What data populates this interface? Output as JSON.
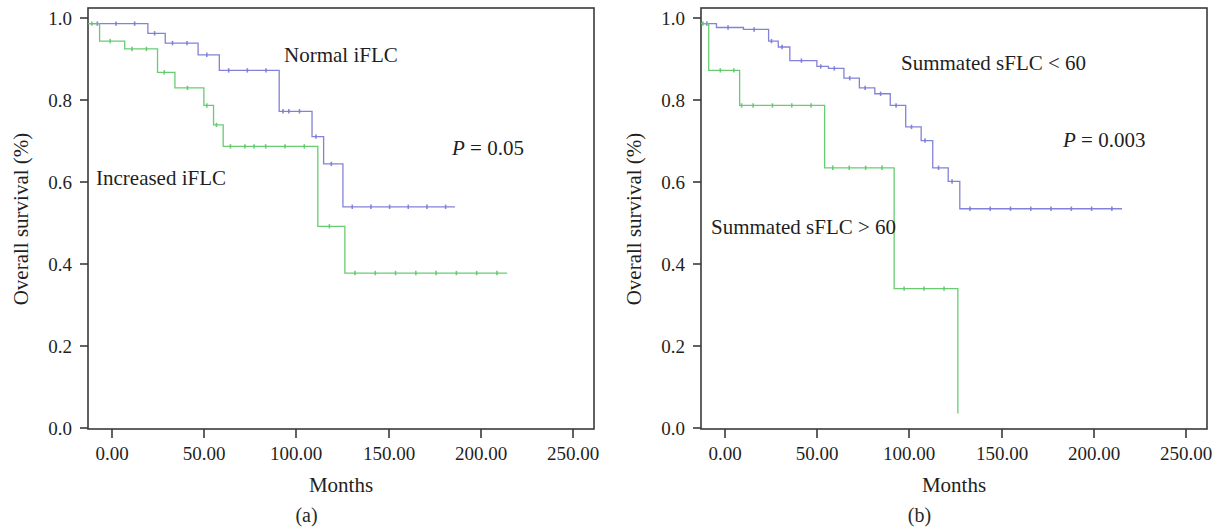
{
  "figure": {
    "panels": [
      {
        "caption": "(a)",
        "xlabel": "Months",
        "ylabel": "Overall survival (%)",
        "xticks": [
          "0.00",
          "50.00",
          "100.00",
          "150.00",
          "200.00",
          "250.00"
        ],
        "yticks": [
          "0.0",
          "0.2",
          "0.4",
          "0.6",
          "0.8",
          "1.0"
        ],
        "pvalue_symbol": "P",
        "pvalue_text": " = 0.05",
        "label_upper": "Normal iFLC",
        "label_lower": "Increased iFLC"
      },
      {
        "caption": "(b)",
        "xlabel": "Months",
        "ylabel": "Overall survival (%)",
        "xticks": [
          "0.00",
          "50.00",
          "100.00",
          "150.00",
          "200.00",
          "250.00"
        ],
        "yticks": [
          "0.0",
          "0.2",
          "0.4",
          "0.6",
          "0.8",
          "1.0"
        ],
        "pvalue_symbol": "P",
        "pvalue_text": " = 0.003",
        "label_upper": "Summated sFLC < 60",
        "label_lower": "Summated sFLC > 60"
      }
    ]
  },
  "colors": {
    "blue": "#7b7bd6",
    "green": "#5fc96a",
    "axis": "#3a3a3a",
    "text": "#1f1f1f",
    "background": "#ffffff"
  },
  "chart_data": [
    {
      "type": "line",
      "chart_style": "kaplan-meier-step",
      "title": "",
      "panel": "(a)",
      "xlabel": "Months",
      "ylabel": "Overall survival (%)",
      "xlim": [
        0,
        262
      ],
      "ylim": [
        -0.04,
        1.04
      ],
      "xticks": [
        0,
        50,
        100,
        150,
        200,
        250
      ],
      "yticks": [
        0.0,
        0.2,
        0.4,
        0.6,
        0.8,
        1.0
      ],
      "grid": false,
      "legend": "inline-annotations",
      "annotations": [
        {
          "text": "Normal iFLC",
          "x": 118,
          "y": 0.935
        },
        {
          "text": "Increased iFLC",
          "x": 30,
          "y": 0.605
        },
        {
          "text": "P = 0.05",
          "x": 192,
          "y": 0.655
        }
      ],
      "series": [
        {
          "name": "Normal iFLC",
          "color": "#7b7bd6",
          "x": [
            0,
            29,
            31,
            38,
            40,
            55,
            57,
            66,
            68,
            97,
            99,
            103,
            105,
            114,
            116,
            120,
            122,
            130,
            132,
            190
          ],
          "y": [
            1.0,
            1.0,
            0.975,
            0.975,
            0.95,
            0.95,
            0.92,
            0.92,
            0.88,
            0.88,
            0.775,
            0.775,
            0.775,
            0.775,
            0.71,
            0.71,
            0.64,
            0.64,
            0.53,
            0.53
          ],
          "plateau_value": 0.53,
          "max_followup": 190
        },
        {
          "name": "Increased iFLC",
          "color": "#5fc96a",
          "x": [
            0,
            4,
            6,
            17,
            19,
            34,
            36,
            43,
            45,
            58,
            60,
            63,
            65,
            68,
            70,
            85,
            87,
            117,
            119,
            131,
            133,
            217
          ],
          "y": [
            1.0,
            1.0,
            0.955,
            0.955,
            0.935,
            0.935,
            0.875,
            0.875,
            0.835,
            0.835,
            0.79,
            0.79,
            0.74,
            0.74,
            0.685,
            0.685,
            0.685,
            0.685,
            0.48,
            0.48,
            0.36,
            0.36
          ],
          "plateau_value": 0.36,
          "max_followup": 217
        }
      ]
    },
    {
      "type": "line",
      "chart_style": "kaplan-meier-step",
      "title": "",
      "panel": "(b)",
      "xlabel": "Months",
      "ylabel": "Overall survival (%)",
      "xlim": [
        0,
        262
      ],
      "ylim": [
        -0.04,
        1.04
      ],
      "xticks": [
        0,
        50,
        100,
        150,
        200,
        250
      ],
      "yticks": [
        0.0,
        0.2,
        0.4,
        0.6,
        0.8,
        1.0
      ],
      "grid": false,
      "legend": "inline-annotations",
      "annotations": [
        {
          "text": "Summated sFLC < 60",
          "x": 110,
          "y": 0.925
        },
        {
          "text": "Summated sFLC > 60",
          "x": 8,
          "y": 0.515
        },
        {
          "text": "P = 0.003",
          "x": 192,
          "y": 0.675
        }
      ],
      "series": [
        {
          "name": "Summated sFLC < 60",
          "color": "#7b7bd6",
          "x": [
            0,
            6,
            8,
            20,
            22,
            33,
            35,
            38,
            40,
            44,
            46,
            58,
            60,
            64,
            66,
            72,
            74,
            80,
            82,
            88,
            90,
            96,
            98,
            104,
            106,
            112,
            114,
            118,
            120,
            126,
            128,
            132,
            134,
            218
          ],
          "y": [
            1.0,
            1.0,
            0.99,
            0.99,
            0.985,
            0.985,
            0.955,
            0.955,
            0.94,
            0.94,
            0.905,
            0.905,
            0.89,
            0.89,
            0.885,
            0.885,
            0.86,
            0.86,
            0.835,
            0.835,
            0.82,
            0.82,
            0.79,
            0.79,
            0.735,
            0.735,
            0.7,
            0.7,
            0.63,
            0.63,
            0.595,
            0.595,
            0.525,
            0.525
          ],
          "plateau_value": 0.525,
          "max_followup": 218
        },
        {
          "name": "Summated sFLC > 60",
          "color": "#5fc96a",
          "x": [
            0,
            2,
            4,
            16,
            18,
            20,
            22,
            62,
            64,
            98,
            100,
            131,
            133
          ],
          "y": [
            1.0,
            1.0,
            0.88,
            0.88,
            0.88,
            0.79,
            0.79,
            0.79,
            0.63,
            0.63,
            0.32,
            0.32,
            0.0
          ],
          "plateau_value": 0.0,
          "max_followup": 131
        }
      ]
    }
  ]
}
